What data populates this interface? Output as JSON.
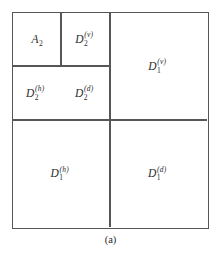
{
  "figure": {
    "caption": "(a)",
    "line_color": "#565656",
    "text_color": "#2b2b2b",
    "background_color": "#ffffff"
  },
  "regions": [
    {
      "name": "approximation-level-2",
      "base": "A",
      "sub": "2",
      "sup": "",
      "label": "A_2"
    },
    {
      "name": "detail-level-2-vertical",
      "base": "D",
      "sub": "2",
      "sup": "(v)",
      "label": "D_2^(v)"
    },
    {
      "name": "detail-level-2-horizontal",
      "base": "D",
      "sub": "2",
      "sup": "(h)",
      "label": "D_2^(h)"
    },
    {
      "name": "detail-level-2-diagonal",
      "base": "D",
      "sub": "2",
      "sup": "(d)",
      "label": "D_2^(d)"
    },
    {
      "name": "detail-level-1-vertical",
      "base": "D",
      "sub": "1",
      "sup": "(v)",
      "label": "D_1^(v)"
    },
    {
      "name": "detail-level-1-horizontal",
      "base": "D",
      "sub": "1",
      "sup": "(h)",
      "label": "D_1^(h)"
    },
    {
      "name": "detail-level-1-diagonal",
      "base": "D",
      "sub": "1",
      "sup": "(d)",
      "label": "D_1^(d)"
    }
  ]
}
